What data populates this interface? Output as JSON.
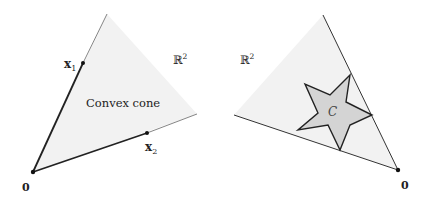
{
  "figure": {
    "left_panel": {
      "region_label": "Convex cone",
      "space_label": "ℝ",
      "space_exponent": "2",
      "origin_label": "0",
      "vector1_label": "x",
      "vector1_subscript": "1",
      "vector2_label": "x",
      "vector2_subscript": "2"
    },
    "right_panel": {
      "space_label": "ℝ",
      "space_exponent": "2",
      "set_label": "C",
      "origin_label": "0"
    },
    "colors": {
      "cone_fill": "#f2f2f2",
      "star_fill": "#d4d4d4",
      "line": "#222222",
      "ray_thin": "#555555"
    }
  }
}
